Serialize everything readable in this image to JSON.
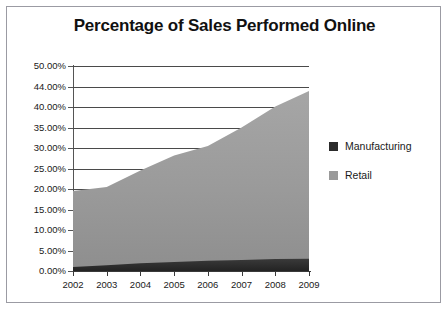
{
  "chart_data": {
    "type": "area",
    "stacked": true,
    "title": "Percentage of Sales Performed Online",
    "xlabel": "",
    "ylabel": "",
    "categories": [
      "2002",
      "2003",
      "2004",
      "2005",
      "2006",
      "2007",
      "2008",
      "2009"
    ],
    "series": [
      {
        "name": "Manufacturing",
        "color": "#2b2b2b",
        "values": [
          1.0,
          1.4,
          1.9,
          2.2,
          2.5,
          2.7,
          2.9,
          3.0
        ]
      },
      {
        "name": "Retail",
        "color": "#9a9a9a",
        "values": [
          18.5,
          19.1,
          22.6,
          26.0,
          28.0,
          32.3,
          37.2,
          40.9
        ]
      }
    ],
    "totals": [
      19.5,
      20.5,
      24.5,
      28.2,
      30.5,
      35.0,
      40.1,
      43.9
    ],
    "ylim": [
      0,
      50
    ],
    "ytick_labels": [
      "50.00%",
      "44.00%",
      "40.00%",
      "35.00%",
      "30.00%",
      "25.00%",
      "20.00%",
      "15.00%",
      "10.00%",
      "5.00%",
      "0.00%"
    ],
    "ytick_values": [
      50,
      44,
      40,
      35,
      30,
      25,
      20,
      15,
      10,
      5,
      0
    ],
    "grid": true,
    "legend_position": "right",
    "legend": [
      "Manufacturing",
      "Retail"
    ]
  },
  "colors": {
    "manufacturing": "#2b2b2b",
    "retail": "#9a9a9a",
    "gridline": "#4a4a4a",
    "border": "#9b9ba3",
    "text": "#1a1a1a",
    "background": "#ffffff"
  }
}
